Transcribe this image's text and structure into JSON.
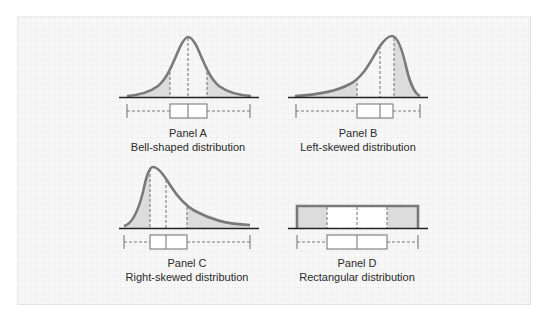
{
  "figure": {
    "panels": [
      {
        "id": "A",
        "label": "Panel A",
        "description": "Bell-shaped distribution",
        "shape": "bell"
      },
      {
        "id": "B",
        "label": "Panel B",
        "description": "Left-skewed distribution",
        "shape": "left-skewed"
      },
      {
        "id": "C",
        "label": "Panel C",
        "description": "Right-skewed distribution",
        "shape": "right-skewed"
      },
      {
        "id": "D",
        "label": "Panel D",
        "description": "Rectangular distribution",
        "shape": "rectangular"
      }
    ],
    "colors": {
      "curve_stroke": "#7a7a7a",
      "tail_fill": "#dcdcdc",
      "box_stroke": "#7a7a7a",
      "baseline": "#222222",
      "background": "#f7f7f7"
    }
  }
}
